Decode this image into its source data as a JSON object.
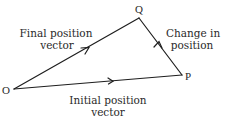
{
  "diagram": {
    "type": "vector-triangle",
    "stroke_color": "#1e1e1e",
    "text_color": "#2a2a2a",
    "points": {
      "O": {
        "label": "O",
        "x": 14,
        "y": 89
      },
      "Q": {
        "label": "Q",
        "x": 139,
        "y": 18
      },
      "P": {
        "label": "P",
        "x": 182,
        "y": 75
      }
    },
    "edges": [
      {
        "from": "O",
        "to": "Q",
        "label_line1": "Final position",
        "label_line2": "vector"
      },
      {
        "from": "O",
        "to": "P",
        "label_line1": "Initial position",
        "label_line2": "vector"
      },
      {
        "from": "P",
        "to": "Q",
        "label_line1": "Change in",
        "label_line2": "position"
      }
    ]
  }
}
